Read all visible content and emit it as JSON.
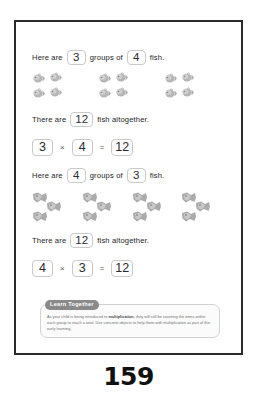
{
  "page": {
    "number": "159",
    "border_color": "#2b2b2b"
  },
  "sections": [
    {
      "id": "section-1",
      "prompt": {
        "lead": "Here are",
        "groups_value": "3",
        "middle": "groups of",
        "per_group_value": "4",
        "trail": "fish."
      },
      "total_sentence": {
        "lead": "There are",
        "total_value": "12",
        "trail": "fish altogether."
      },
      "equation": {
        "left": "3",
        "operator": "×",
        "right": "4",
        "equals": "=",
        "result": "12"
      },
      "fish": {
        "groups": 3,
        "per_group": 4,
        "arrangement": "2x2",
        "sprite": "fish-small-icon"
      }
    },
    {
      "id": "section-2",
      "prompt": {
        "lead": "Here are",
        "groups_value": "4",
        "middle": "groups of",
        "per_group_value": "3",
        "trail": "fish."
      },
      "total_sentence": {
        "lead": "There are",
        "total_value": "12",
        "trail": "fish altogether."
      },
      "equation": {
        "left": "4",
        "operator": "×",
        "right": "3",
        "equals": "=",
        "result": "12"
      },
      "fish": {
        "groups": 4,
        "per_group": 3,
        "arrangement": "triangle",
        "sprite": "fish-large-icon"
      }
    }
  ],
  "learn_together": {
    "badge": "Learn Together",
    "body_before": "As your child is being introduced to ",
    "body_keyword": "multiplication",
    "body_after": ", they will still be counting the items within each group to reach a total. Use concrete objects to help them with multiplication as part of this early learning."
  }
}
